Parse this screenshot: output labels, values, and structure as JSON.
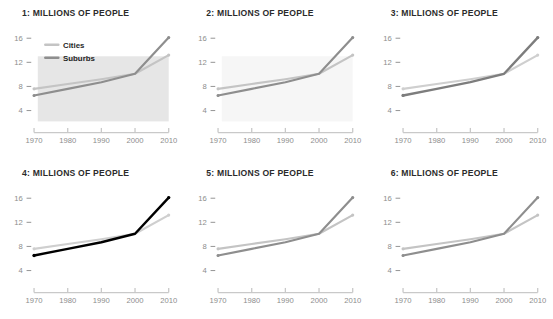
{
  "figure": {
    "kind": "small-multiples-line-chart-grid",
    "rows": 2,
    "cols": 3,
    "background": "#ffffff"
  },
  "axis": {
    "y_ticks": [
      "16",
      "12",
      "8",
      "4"
    ],
    "y_values": [
      16,
      12,
      8,
      4
    ],
    "x_ticks": [
      "1970",
      "1980",
      "1990",
      "2000",
      "2010"
    ],
    "x_values": [
      1970,
      1980,
      1990,
      2000,
      2010
    ],
    "ylim": [
      2.2,
      17.4
    ],
    "xlim": [
      1970,
      2010
    ],
    "tick_color": "#8d8d8d",
    "axis_line_color": "#c9c9c9"
  },
  "legend": {
    "visible_in_panel": 1,
    "entries": [
      {
        "label": "Cities",
        "color": "#c4c4c4"
      },
      {
        "label": "Suburbs",
        "color": "#8e8e8e"
      }
    ]
  },
  "panels": [
    {
      "number": "1",
      "title": "1: MILLIONS OF PEOPLE",
      "show_legend": true,
      "shaded_region": true,
      "shade_color": "#e6e6e6",
      "cities_color": "#c4c4c4",
      "suburbs_color": "#8e8e8e",
      "cities_width": 2.3,
      "suburbs_width": 2.3
    },
    {
      "number": "2",
      "title": "2: MILLIONS OF PEOPLE",
      "show_legend": false,
      "shaded_region": true,
      "shade_color": "#f6f6f6",
      "cities_color": "#c4c4c4",
      "suburbs_color": "#8e8e8e",
      "cities_width": 2.3,
      "suburbs_width": 2.3
    },
    {
      "number": "3",
      "title": "3: MILLIONS OF PEOPLE",
      "show_legend": false,
      "shaded_region": false,
      "shade_color": "#ffffff",
      "cities_color": "#cfcfcf",
      "suburbs_color": "#7d7d7d",
      "cities_width": 2.3,
      "suburbs_width": 2.5
    },
    {
      "number": "4",
      "title": "4: MILLIONS OF PEOPLE",
      "show_legend": false,
      "shaded_region": false,
      "shade_color": "#ffffff",
      "cities_color": "#cfcfcf",
      "suburbs_color": "#000000",
      "cities_width": 2.3,
      "suburbs_width": 2.6
    },
    {
      "number": "5",
      "title": "5: MILLIONS OF PEOPLE",
      "show_legend": false,
      "shaded_region": false,
      "shade_color": "#ffffff",
      "cities_color": "#c4c4c4",
      "suburbs_color": "#8e8e8e",
      "cities_width": 2.3,
      "suburbs_width": 2.3
    },
    {
      "number": "6",
      "title": "6: MILLIONS OF PEOPLE",
      "show_legend": false,
      "shaded_region": false,
      "shade_color": "#ffffff",
      "cities_color": "#c4c4c4",
      "suburbs_color": "#8e8e8e",
      "cities_width": 2.3,
      "suburbs_width": 2.3
    }
  ],
  "chart_data": {
    "type": "line",
    "title": "MILLIONS OF PEOPLE",
    "xlabel": "",
    "ylabel": "Millions of people",
    "x": [
      1970,
      1980,
      1990,
      2000,
      2010
    ],
    "xlim": [
      1970,
      2010
    ],
    "ylim": [
      2.2,
      17.4
    ],
    "yticks": [
      4,
      8,
      12,
      16
    ],
    "xticks": [
      1970,
      1980,
      1990,
      2000,
      2010
    ],
    "grid": false,
    "legend_position": "upper-left",
    "markers": true,
    "series": [
      {
        "name": "Cities",
        "values": [
          7.6,
          8.4,
          9.2,
          10.1,
          13.2
        ],
        "color": "#c4c4c4"
      },
      {
        "name": "Suburbs",
        "values": [
          6.5,
          7.6,
          8.7,
          10.1,
          16.1
        ],
        "color": "#8e8e8e"
      }
    ],
    "panel_count": 6,
    "panel_titles": [
      "1: MILLIONS OF PEOPLE",
      "2: MILLIONS OF PEOPLE",
      "3: MILLIONS OF PEOPLE",
      "4: MILLIONS OF PEOPLE",
      "5: MILLIONS OF PEOPLE",
      "6: MILLIONS OF PEOPLE"
    ],
    "note": "Identical Cities/Suburbs series repeated across six panels with varying emphasis styling."
  }
}
